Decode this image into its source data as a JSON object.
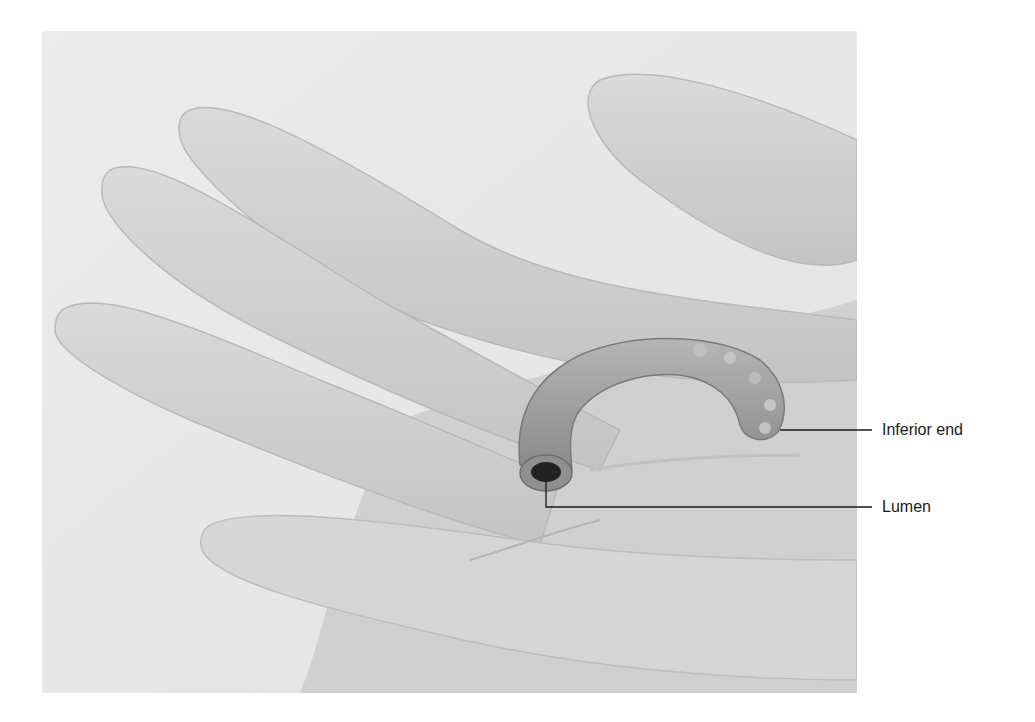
{
  "figure": {
    "labels": [
      {
        "id": "inferior-end",
        "text": "Inferior end",
        "leader_from": [
          780,
          430
        ],
        "leader_to": [
          872,
          430
        ]
      },
      {
        "id": "lumen",
        "text": "Lumen",
        "leader_from": [
          546,
          482
        ],
        "leader_elbow": [
          546,
          507
        ],
        "leader_to": [
          872,
          507
        ]
      }
    ]
  },
  "colors": {
    "background": "#ffffff",
    "photo_bg": "#e9e9e9",
    "glove": "#d2d2d2",
    "glove_shadow": "#bdbdbd",
    "specimen": "#9a9a9a",
    "lumen": "#222222",
    "leader": "#1a1a1a",
    "label_text": "#1a1a1a"
  }
}
